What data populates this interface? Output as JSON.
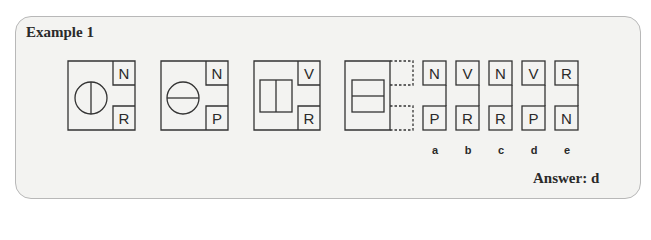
{
  "title": "Example 1",
  "answer_text": "Answer: d",
  "colors": {
    "line": "#333333",
    "panel_bg": "#f3f3f1",
    "panel_border": "#b8b8b8"
  },
  "figures": [
    {
      "shape": "circle-vertical-line",
      "top_letter": "N",
      "bottom_letter": "R"
    },
    {
      "shape": "circle-horizontal-line",
      "top_letter": "N",
      "bottom_letter": "P"
    },
    {
      "shape": "rectangle-vertical-line",
      "top_letter": "V",
      "bottom_letter": "R"
    },
    {
      "shape": "rectangle-horizontal-line",
      "top_letter": "",
      "bottom_letter": "",
      "missing": true
    }
  ],
  "options": [
    {
      "label": "a",
      "top_letter": "N",
      "bottom_letter": "P"
    },
    {
      "label": "b",
      "top_letter": "V",
      "bottom_letter": "R"
    },
    {
      "label": "c",
      "top_letter": "N",
      "bottom_letter": "R"
    },
    {
      "label": "d",
      "top_letter": "V",
      "bottom_letter": "P"
    },
    {
      "label": "e",
      "top_letter": "R",
      "bottom_letter": "N"
    }
  ]
}
